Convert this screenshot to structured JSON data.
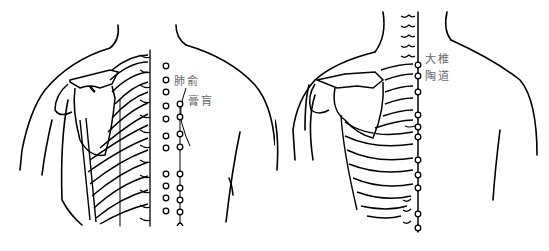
{
  "figure": {
    "panels": [
      {
        "id": "left",
        "view": "posterior upper back with scapula and rib cage",
        "labels": [
          {
            "text": "肺俞",
            "x": 174,
            "y": 76
          },
          {
            "text": "膏肓",
            "x": 188,
            "y": 96
          }
        ],
        "point_columns": {
          "outer": [
            66,
            80,
            92,
            106,
            119,
            136,
            148,
            174,
            186,
            198,
            211
          ],
          "inner": [
            104,
            117,
            134,
            147,
            174,
            188,
            200,
            212,
            224
          ]
        }
      },
      {
        "id": "right",
        "view": "posterior upper back showing spine midline",
        "labels": [
          {
            "text": "大椎",
            "x": 425,
            "y": 54
          },
          {
            "text": "陶道",
            "x": 425,
            "y": 71
          }
        ],
        "midline_points": [
          65,
          76,
          92,
          115,
          127,
          137,
          160,
          175,
          188,
          214,
          228
        ]
      }
    ],
    "colors": {
      "line": "#000000",
      "label": "#666666",
      "background": "#ffffff"
    }
  }
}
